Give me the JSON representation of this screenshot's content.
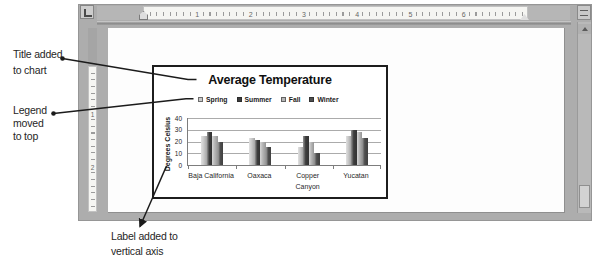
{
  "window": {
    "ruler_h_numbers": [
      "1",
      "2",
      "3",
      "4",
      "5",
      "6"
    ],
    "ruler_v_numbers": [
      "1",
      "2"
    ]
  },
  "callouts": {
    "title": {
      "lines": [
        "Title added",
        "to chart"
      ]
    },
    "legend": {
      "lines": [
        "Legend",
        "moved",
        "to top"
      ]
    },
    "axis": {
      "lines": [
        "Label added to",
        "vertical axis"
      ]
    }
  },
  "chart_data": {
    "type": "bar",
    "title": "Average Temperature",
    "ylabel": "Degrees Celsius",
    "categories": [
      "Baja California",
      "Oaxaca",
      "Copper Canyon",
      "Yucatan"
    ],
    "series": [
      {
        "name": "Spring",
        "color": "#c9c9c9",
        "values": [
          25,
          23,
          15,
          25
        ]
      },
      {
        "name": "Summer",
        "color": "#3d3d3d",
        "values": [
          28,
          21,
          25,
          30
        ]
      },
      {
        "name": "Fall",
        "color": "#b6b6b6",
        "values": [
          25,
          20,
          20,
          28
        ]
      },
      {
        "name": "Winter",
        "color": "#4e4e4e",
        "values": [
          20,
          15,
          10,
          23
        ]
      }
    ],
    "ylim": [
      0,
      40
    ],
    "yticks": [
      0,
      10,
      20,
      30,
      40
    ],
    "legend_position": "top",
    "grid": true
  }
}
